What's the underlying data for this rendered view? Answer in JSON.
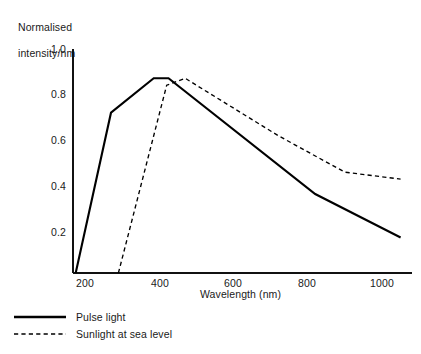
{
  "chart_data": {
    "type": "line",
    "title": "",
    "xlabel": "Wavelength (nm)",
    "ylabel": "Normalised intensity/nm",
    "ylabel_line1": "Normalised",
    "ylabel_line2": "intensity/nm",
    "xlim": [
      175,
      1055
    ],
    "ylim": [
      0,
      1.0
    ],
    "grid": false,
    "legend_position": "below-left",
    "xticks": [
      200,
      400,
      600,
      800,
      1000
    ],
    "xtick_labels": [
      "200",
      "400",
      "600",
      "800",
      "1000"
    ],
    "yticks": [
      0.2,
      0.4,
      0.6,
      0.8,
      1.0
    ],
    "ytick_labels": [
      "0.2",
      "0.4",
      "0.6",
      "0.8",
      "1.0"
    ],
    "series": [
      {
        "name": "Pulse light",
        "style": "solid",
        "color": "#000000",
        "x": [
          175,
          270,
          385,
          425,
          820,
          1050
        ],
        "values": [
          0.0,
          0.7,
          0.85,
          0.85,
          0.345,
          0.155
        ]
      },
      {
        "name": "Sunlight at sea level",
        "style": "dashed",
        "color": "#000000",
        "x": [
          290,
          420,
          470,
          720,
          900,
          1050
        ],
        "values": [
          0.0,
          0.82,
          0.85,
          0.6,
          0.44,
          0.41
        ]
      }
    ]
  },
  "legend": {
    "items": [
      {
        "label": "Pulse light",
        "style": "solid"
      },
      {
        "label": "Sunlight at sea level",
        "style": "dashed"
      }
    ]
  },
  "axes": {
    "x_axis_name": "wavelength-axis",
    "y_axis_name": "intensity-axis"
  }
}
